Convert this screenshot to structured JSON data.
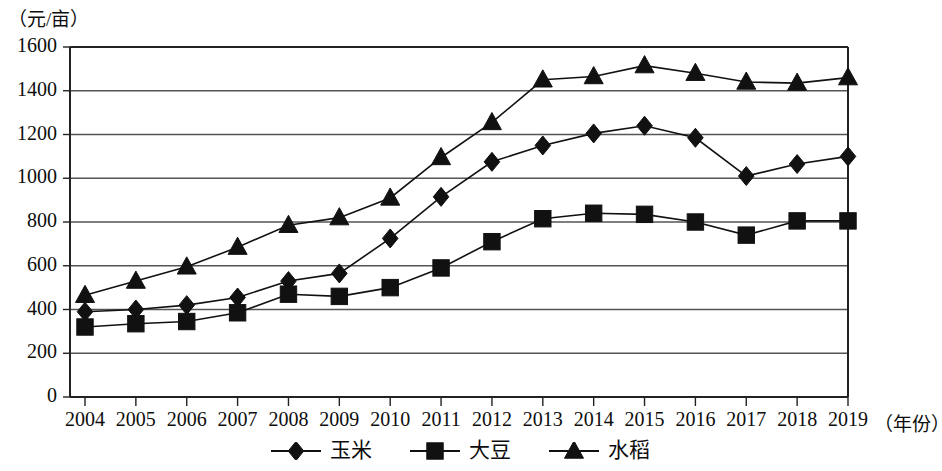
{
  "chart_data": {
    "type": "line",
    "title": "",
    "subtitle": "",
    "ylabel": "（元/亩）",
    "xlabel": "（年份）",
    "grid": true,
    "legend_position": "bottom",
    "xlim": [
      2004,
      2019
    ],
    "ylim": [
      0,
      1600
    ],
    "ytick_step": 200,
    "categories": [
      "2004",
      "2005",
      "2006",
      "2007",
      "2008",
      "2009",
      "2010",
      "2011",
      "2012",
      "2013",
      "2014",
      "2015",
      "2016",
      "2017",
      "2018",
      "2019"
    ],
    "yticks": [
      "0",
      "200",
      "400",
      "600",
      "800",
      "1000",
      "1200",
      "1400",
      "1600"
    ],
    "series": [
      {
        "name": "玉米",
        "marker": "diamond",
        "values": [
          390,
          400,
          420,
          455,
          530,
          565,
          725,
          915,
          1075,
          1150,
          1205,
          1240,
          1185,
          1010,
          1065,
          1100
        ]
      },
      {
        "name": "大豆",
        "marker": "square",
        "values": [
          320,
          335,
          345,
          385,
          470,
          460,
          500,
          590,
          710,
          815,
          840,
          835,
          800,
          740,
          805,
          805
        ]
      },
      {
        "name": "水稻",
        "marker": "triangle",
        "values": [
          465,
          530,
          595,
          685,
          785,
          820,
          910,
          1095,
          1255,
          1450,
          1465,
          1515,
          1480,
          1440,
          1435,
          1460
        ]
      }
    ],
    "colors": {
      "line": "#111111",
      "grid": "#555555",
      "axis": "#222222",
      "text": "#0d0d0d",
      "background": "#ffffff"
    }
  }
}
